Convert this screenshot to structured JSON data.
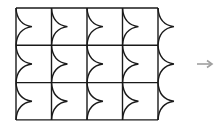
{
  "diagram": {
    "type": "tessellation-grid",
    "rows": 3,
    "columns": 4,
    "curve_columns": 5,
    "grid": {
      "x0": 16,
      "y0": 8,
      "cell_w": 35.5,
      "cell_h": 37.3
    },
    "curve_depth": 16,
    "colors": {
      "line": "#1a1a1a",
      "arrow": "#a0a0a0",
      "background": "#ffffff"
    },
    "arrow": {
      "label": "",
      "icon": "right-arrow-icon"
    }
  }
}
